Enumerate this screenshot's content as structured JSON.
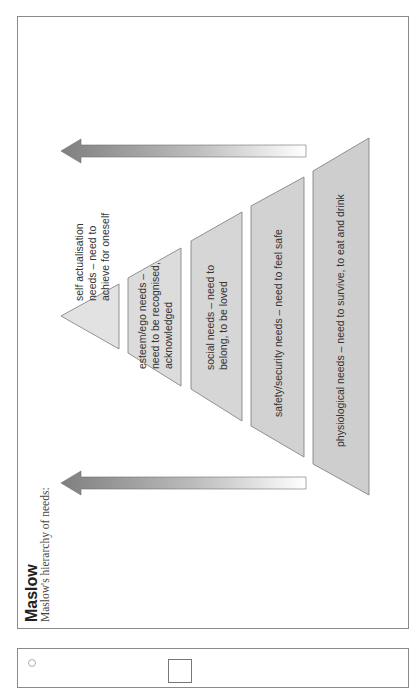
{
  "header": {
    "title": "Maslow",
    "subtitle": "Maslow's hierarchy of needs:"
  },
  "pyramid": {
    "levels": [
      {
        "id": "self-actualisation",
        "lines": [
          "self actualisation",
          "needs – need to",
          "achieve for oneself"
        ]
      },
      {
        "id": "esteem",
        "lines": [
          "esteem/ego needs –",
          "need to be recognised,",
          "acknowledged"
        ]
      },
      {
        "id": "social",
        "lines": [
          "social needs – need to",
          "belong, to be loved"
        ]
      },
      {
        "id": "safety",
        "lines": [
          "safety/security needs – need to feel safe"
        ]
      },
      {
        "id": "physiological",
        "lines": [
          "physiological needs – need to survive, to eat and drink"
        ]
      }
    ],
    "fill_color": "#d6d6d6",
    "stroke_color": "#7a7a7a"
  },
  "arrows": {
    "direction": "toward top of hierarchy",
    "color": "#8c8c8c"
  },
  "footer_box": {
    "page_number": ""
  }
}
